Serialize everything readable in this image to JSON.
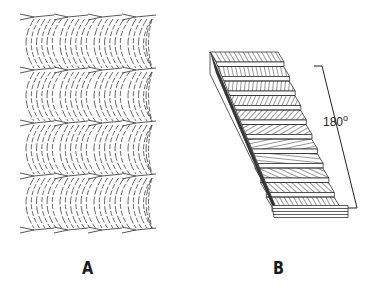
{
  "figure": {
    "panels": [
      {
        "id": "A",
        "label": "A",
        "description": "Nested arced fibril pattern (oblique section of twisted plywood)",
        "arc_rows": 4,
        "arc_columns": 4
      },
      {
        "id": "B",
        "label": "B",
        "description": "Stacked lamellae with progressively rotating fibril orientation (Bouligand structure)",
        "layer_count": 11,
        "rotation_annotation": {
          "value": "180",
          "unit": "o"
        }
      }
    ],
    "colors": {
      "line": "#333333",
      "background": "#ffffff"
    }
  }
}
